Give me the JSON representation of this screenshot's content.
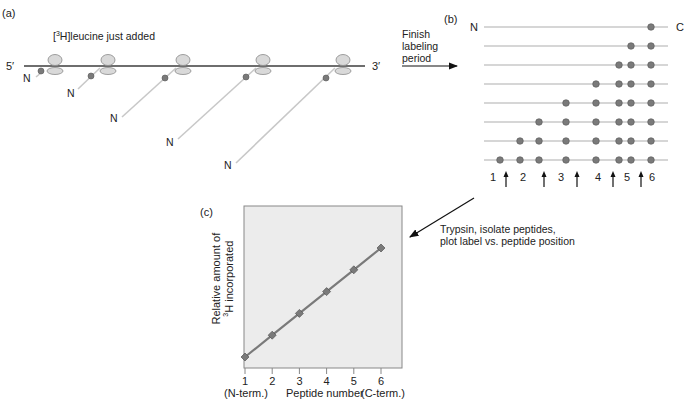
{
  "panel_a": {
    "label": "(a)",
    "title_prefix": "[",
    "title_sup": "3",
    "title_rest": "H]leucine just added",
    "five_prime": "5′",
    "three_prime": "3′",
    "n_label": "N",
    "ribosome_count": 5
  },
  "transition_ab": {
    "line1": "Finish",
    "line2": "labeling",
    "line3": "period"
  },
  "panel_b": {
    "label": "(b)",
    "n_label": "N",
    "c_label": "C",
    "peptide_numbers": [
      "1",
      "2",
      "3",
      "4",
      "5",
      "6"
    ],
    "rows": [
      {
        "dots": [
          7
        ]
      },
      {
        "dots": [
          6,
          7
        ]
      },
      {
        "dots": [
          5,
          6,
          7
        ]
      },
      {
        "dots": [
          4,
          5,
          6,
          7
        ]
      },
      {
        "dots": [
          3,
          4,
          5,
          6,
          7
        ]
      },
      {
        "dots": [
          2,
          3,
          4,
          5,
          6,
          7
        ]
      },
      {
        "dots": [
          1,
          2,
          3,
          4,
          5,
          6,
          7
        ]
      },
      {
        "dots": [
          0,
          1,
          2,
          3,
          4,
          5,
          6,
          7
        ]
      }
    ],
    "cleavage_arrow_count": 5
  },
  "transition_bc": {
    "line1": "Trypsin, isolate peptides,",
    "line2": "plot label vs. peptide position"
  },
  "panel_c": {
    "label": "(c)",
    "ylabel_line1": "Relative amount of",
    "ylabel_sup": "3",
    "ylabel_line2": "H incorporated",
    "xlabel": "Peptide number",
    "x_left_note": "(N-term.)",
    "x_right_note": "(C-term.)",
    "x_ticks": [
      "1",
      "2",
      "3",
      "4",
      "5",
      "6"
    ]
  },
  "colors": {
    "mrna": "#6e6e6e",
    "peptide_chain": "#c8c8c8",
    "dot": "#7a7a7a",
    "ribosome_fill": "#d9d9d9",
    "plot_bg": "#ececec",
    "plot_line": "#7a7a7a"
  },
  "chart_data": {
    "type": "line",
    "title": "",
    "xlabel": "Peptide number",
    "ylabel": "Relative amount of 3H incorporated",
    "categories": [
      "1",
      "2",
      "3",
      "4",
      "5",
      "6"
    ],
    "x": [
      1,
      2,
      3,
      4,
      5,
      6
    ],
    "values": [
      0,
      1,
      2,
      3,
      4,
      5
    ],
    "x_annotations": {
      "1": "(N-term.)",
      "6": "(C-term.)"
    },
    "ylim": [
      0,
      5.4
    ],
    "grid": false,
    "legend": "none",
    "marker": "diamond"
  }
}
